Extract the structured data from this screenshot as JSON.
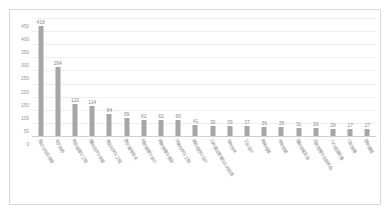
{
  "chart_data": {
    "type": "bar",
    "title": "",
    "xlabel": "",
    "ylabel": "",
    "ylim": [
      0,
      450
    ],
    "yticks": [
      0,
      50,
      100,
      150,
      200,
      250,
      300,
      350,
      400,
      450
    ],
    "grid": true,
    "legend": "none",
    "bar_color": "#a6a6a6",
    "categories": [
      "劳动与社会保障",
      "电子商务",
      "物流管理与工程",
      "国际经济与贸易",
      "食品科学与工程",
      "数字媒体技术",
      "财务管理与会计",
      "旅游管理与服务",
      "环境科学与工程",
      "城市规划与设计",
      "公共事业管理与公共政策",
      "生物技术",
      "工业设计",
      "新闻传播",
      "市场营销",
      "国际贸易实务",
      "信息管理与信息系统",
      "人力资源管理",
      "行政管理",
      "图书情报"
    ],
    "values": [
      418,
      264,
      122,
      114,
      84,
      69,
      62,
      62,
      60,
      41,
      39,
      39,
      37,
      36,
      35,
      31,
      29,
      28,
      27,
      27
    ]
  }
}
